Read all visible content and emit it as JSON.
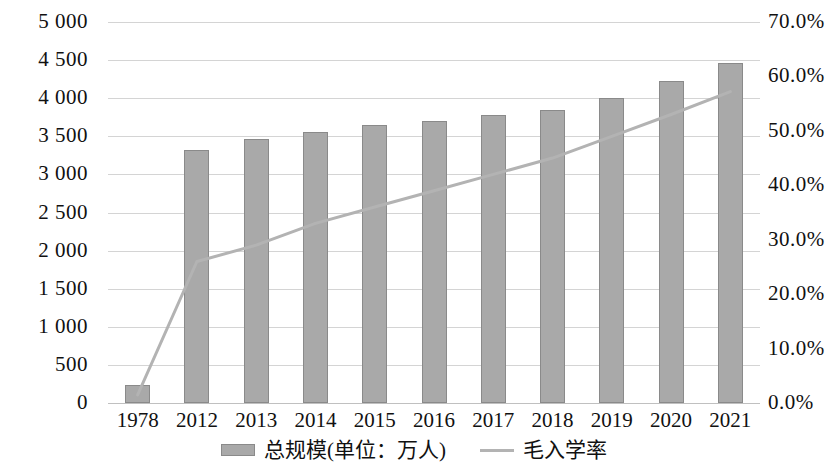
{
  "chart_data": {
    "type": "bar",
    "title": "",
    "subtitle": "",
    "xlabel": "",
    "ylabel": "",
    "categories": [
      "1978",
      "2012",
      "2013",
      "2014",
      "2015",
      "2016",
      "2017",
      "2018",
      "2019",
      "2020",
      "2021"
    ],
    "grid": true,
    "legend_position": "bottom",
    "axes": {
      "left": {
        "label": "",
        "min": 0,
        "max": 5000,
        "step": 500,
        "ticks": [
          "0",
          "500",
          "1 000",
          "1 500",
          "2 000",
          "2 500",
          "3 000",
          "3 500",
          "4 000",
          "4 500",
          "5 000"
        ],
        "tick_values": [
          0,
          500,
          1000,
          1500,
          2000,
          2500,
          3000,
          3500,
          4000,
          4500,
          5000
        ]
      },
      "right": {
        "label": "",
        "min": 0,
        "max": 70,
        "step": 10,
        "ticks": [
          "0.0%",
          "10.0%",
          "20.0%",
          "30.0%",
          "40.0%",
          "50.0%",
          "60.0%",
          "70.0%"
        ],
        "tick_values": [
          0,
          10,
          20,
          30,
          40,
          50,
          60,
          70
        ]
      }
    },
    "series": [
      {
        "name": "总规模(单位：万人)",
        "type": "bar",
        "axis": "left",
        "color": "#a9a9a9",
        "border_color": "#8a8a8a",
        "values": [
          235,
          3325,
          3460,
          3560,
          3650,
          3700,
          3780,
          3850,
          4000,
          4230,
          4460
        ]
      },
      {
        "name": "毛入学率",
        "type": "line",
        "axis": "right",
        "color": "#b3b3b3",
        "values": [
          1.5,
          26.0,
          29.0,
          33.0,
          36.0,
          39.0,
          42.0,
          45.0,
          49.0,
          53.0,
          57.2
        ]
      }
    ]
  },
  "legend": {
    "items": [
      {
        "label": "总规模(单位：万人)",
        "marker": "bar-swatch"
      },
      {
        "label": "毛入学率",
        "marker": "line-swatch"
      }
    ]
  },
  "colors": {
    "bar_fill": "#a9a9a9",
    "bar_border": "#8a8a8a",
    "line": "#b3b3b3",
    "gridline": "#d4d4d4",
    "axis": "#c0c0c0",
    "text": "#111111",
    "background": "#ffffff"
  }
}
